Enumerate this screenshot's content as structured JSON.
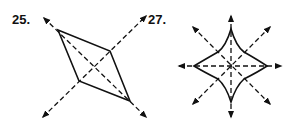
{
  "figures": [
    {
      "number": "25.",
      "shape": "rhombus",
      "lines_of_symmetry": 2
    },
    {
      "number": "27.",
      "shape": "four-pointed star",
      "lines_of_symmetry": 4
    }
  ],
  "colors": {
    "stroke": "#111111",
    "background": "#ffffff"
  }
}
